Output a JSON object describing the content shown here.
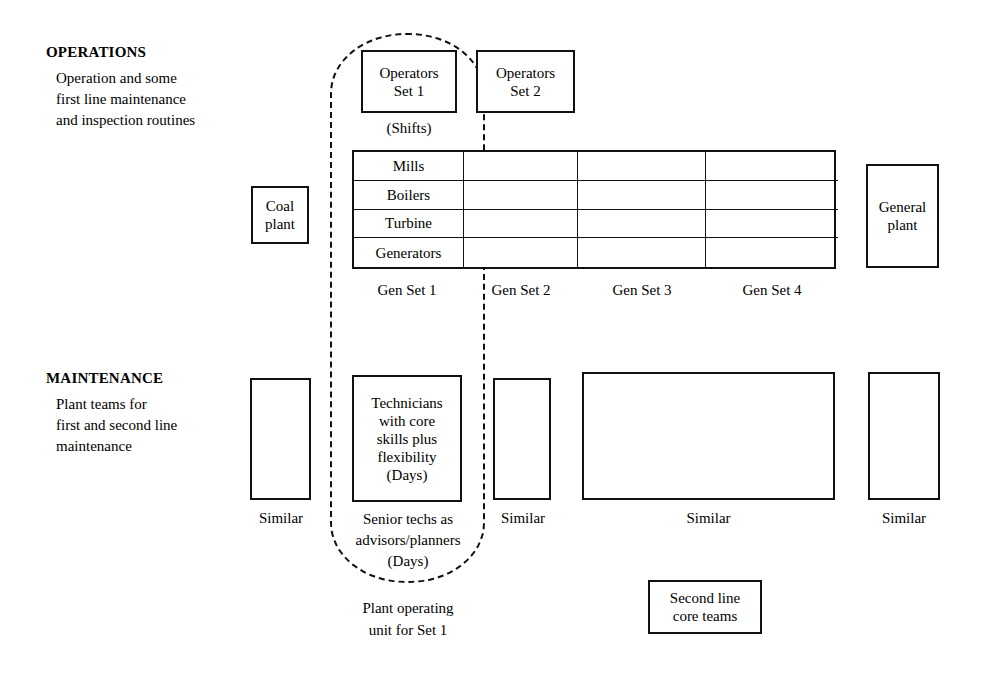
{
  "diagram": {
    "sections": {
      "operations": {
        "heading": "OPERATIONS",
        "description_lines": [
          "Operation and some",
          "first line maintenance",
          "and inspection routines"
        ]
      },
      "maintenance": {
        "heading": "MAINTENANCE",
        "description_lines": [
          "Plant teams for",
          "first and second line",
          "maintenance"
        ]
      }
    },
    "operations_boxes": [
      {
        "line1": "Operators",
        "line2": "Set 1"
      },
      {
        "line1": "Operators",
        "line2": "Set 2"
      }
    ],
    "shifts_caption": "(Shifts)",
    "coal_plant": {
      "line1": "Coal",
      "line2": "plant"
    },
    "general_plant": {
      "line1": "General",
      "line2": "plant"
    },
    "gen_matrix": {
      "row_labels": [
        "Mills",
        "Boilers",
        "Turbine",
        "Generators"
      ],
      "column_labels": [
        "Gen Set 1",
        "Gen Set 2",
        "Gen Set 3",
        "Gen Set 4"
      ],
      "rows": 4,
      "columns": 4
    },
    "technicians_box": {
      "lines": [
        "Technicians",
        "with core",
        "skills plus",
        "flexibility",
        "(Days)"
      ]
    },
    "senior_techs_caption": {
      "lines": [
        "Senior techs as",
        "advisors/planners",
        "(Days)"
      ]
    },
    "similar_labels": [
      "Similar",
      "Similar",
      "Similar",
      "Similar"
    ],
    "plant_operating_unit_caption": {
      "lines": [
        "Plant operating",
        "unit for Set 1"
      ]
    },
    "second_line_core_teams": {
      "line1": "Second line",
      "line2": "core teams"
    },
    "colors": {
      "stroke": "#111111",
      "background": "#ffffff",
      "text": "#000000"
    }
  }
}
